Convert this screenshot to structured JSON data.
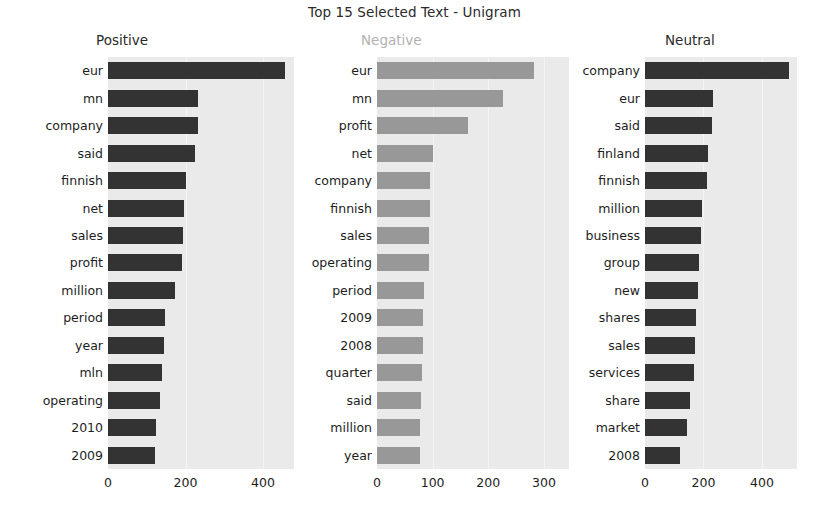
{
  "chart_data": {
    "type": "bar",
    "title": "Top 15 Selected Text - Unigram",
    "orientation": "horizontal",
    "grid": true,
    "legend": "none",
    "xlabel": "",
    "ylabel": "",
    "panels": [
      {
        "name": "positive",
        "title": "Positive",
        "title_color": "#2a2a2a",
        "bar_color": "#333333",
        "xlim": [
          0,
          480
        ],
        "xticks": [
          0,
          200,
          400
        ],
        "xticklabels": [
          "0",
          "200",
          "400"
        ],
        "categories": [
          "eur",
          "mn",
          "company",
          "said",
          "finnish",
          "net",
          "sales",
          "profit",
          "million",
          "period",
          "year",
          "mln",
          "operating",
          "2010",
          "2009"
        ],
        "values": [
          456,
          232,
          232,
          225,
          200,
          196,
          193,
          190,
          172,
          147,
          145,
          140,
          133,
          125,
          122
        ]
      },
      {
        "name": "negative",
        "title": "Negative",
        "title_color": "#b2b2b2",
        "bar_color": "#989898",
        "xlim": [
          0,
          345
        ],
        "xticks": [
          0,
          100,
          200,
          300
        ],
        "xticklabels": [
          "0",
          "100",
          "200",
          "300"
        ],
        "categories": [
          "eur",
          "mn",
          "profit",
          "net",
          "company",
          "finnish",
          "sales",
          "operating",
          "period",
          "2009",
          "2008",
          "quarter",
          "said",
          "million",
          "year"
        ],
        "values": [
          283,
          227,
          163,
          101,
          95,
          95,
          94,
          94,
          85,
          82,
          82,
          80,
          79,
          78,
          77
        ]
      },
      {
        "name": "neutral",
        "title": "Neutral",
        "title_color": "#2a2a2a",
        "bar_color": "#333333",
        "xlim": [
          0,
          520
        ],
        "xticks": [
          0,
          200,
          400
        ],
        "xticklabels": [
          "0",
          "200",
          "400"
        ],
        "categories": [
          "company",
          "eur",
          "said",
          "finland",
          "finnish",
          "million",
          "business",
          "group",
          "new",
          "shares",
          "sales",
          "services",
          "share",
          "market",
          "2008"
        ],
        "values": [
          494,
          232,
          230,
          215,
          212,
          196,
          190,
          185,
          180,
          175,
          172,
          168,
          155,
          143,
          119
        ]
      }
    ]
  }
}
